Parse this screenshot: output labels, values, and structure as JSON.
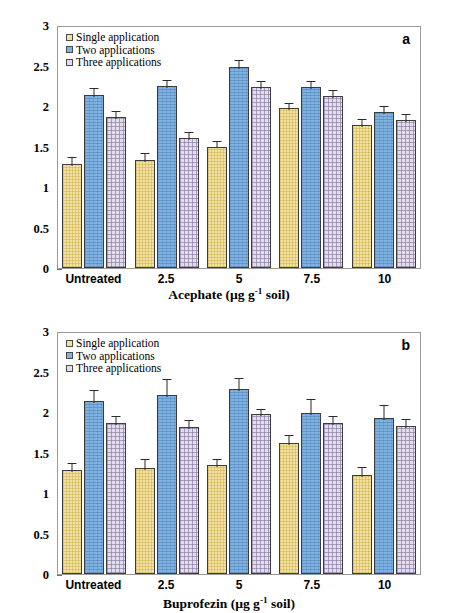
{
  "figure": {
    "panels": [
      {
        "id": "a",
        "letter": "a",
        "xlabel_main": "Acephate",
        "xlabel_units": "(µg g",
        "xlabel_units_sup": "-1",
        "xlabel_units_tail": " soil)"
      },
      {
        "id": "b",
        "letter": "b",
        "xlabel_main": "Buprofezin",
        "xlabel_units": "(µg g",
        "xlabel_units_sup": "-1",
        "xlabel_units_tail": " soil)"
      }
    ],
    "ylabel_parts": {
      "p1": "mg glucose g",
      "sup1": "-1",
      "p2": " soil 24 h",
      "sup2": "-1"
    },
    "legend": {
      "items": [
        {
          "label": "Single application",
          "color": "#f3e1a2"
        },
        {
          "label": "Two applications",
          "color": "#7fb2e0"
        },
        {
          "label": "Three applications",
          "color": "#e2dced"
        }
      ]
    },
    "yticks": [
      "0",
      "0.5",
      "1",
      "1.5",
      "2",
      "2.5",
      "3"
    ]
  },
  "chart_data": [
    {
      "type": "bar",
      "panel": "a",
      "title": "",
      "xlabel": "Acephate (µg g-1 soil)",
      "ylabel": "mg glucose g-1 soil 24 h-1",
      "ylim": [
        0,
        3
      ],
      "yticks": [
        0,
        0.5,
        1,
        1.5,
        2,
        2.5,
        3
      ],
      "grid": false,
      "legend_position": "top-left",
      "categories": [
        "Untreated",
        "2.5",
        "5",
        "7.5",
        "10"
      ],
      "series": [
        {
          "name": "Single application",
          "color": "#f3e1a2",
          "values": [
            1.29,
            1.33,
            1.5,
            1.97,
            1.77
          ],
          "errors": [
            0.11,
            0.12,
            0.09,
            0.09,
            0.09
          ]
        },
        {
          "name": "Two applications",
          "color": "#7fb2e0",
          "values": [
            2.13,
            2.25,
            2.48,
            2.23,
            1.93
          ],
          "errors": [
            0.12,
            0.09,
            0.11,
            0.1,
            0.1
          ]
        },
        {
          "name": "Three applications",
          "color": "#e2dced",
          "values": [
            1.86,
            1.6,
            2.23,
            2.12,
            1.83
          ]
        }
      ]
    },
    {
      "type": "bar",
      "panel": "b",
      "title": "",
      "xlabel": "Buprofezin (µg g-1 soil)",
      "ylabel": "mg glucose g-1 soil 24 h-1",
      "ylim": [
        0,
        3
      ],
      "yticks": [
        0,
        0.5,
        1,
        1.5,
        2,
        2.5,
        3
      ],
      "grid": false,
      "legend_position": "top-left",
      "categories": [
        "Untreated",
        "2.5",
        "5",
        "7.5",
        "10"
      ],
      "series": [
        {
          "name": "Single application",
          "color": "#f3e1a2",
          "values": [
            1.29,
            1.31,
            1.34,
            1.62,
            1.22
          ],
          "errors": [
            0.11,
            0.13,
            0.11,
            0.12,
            0.13
          ]
        },
        {
          "name": "Two applications",
          "color": "#7fb2e0",
          "values": [
            2.13,
            2.21,
            2.28,
            1.99,
            1.93
          ],
          "errors": [
            0.17,
            0.22,
            0.16,
            0.19,
            0.18
          ]
        },
        {
          "name": "Three applications",
          "color": "#e2dced",
          "values": [
            1.87,
            1.81,
            1.97,
            1.86,
            1.83
          ],
          "errors": [
            0.1,
            0.11,
            0.09,
            0.11,
            0.11
          ]
        }
      ]
    }
  ]
}
